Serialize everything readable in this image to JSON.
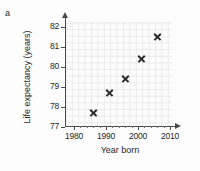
{
  "panel": {
    "label": "a"
  },
  "chart_data": {
    "type": "scatter",
    "title": "",
    "xlabel": "Year born",
    "ylabel": "Life expectancy (years)",
    "xlim": [
      1978,
      2012
    ],
    "ylim": [
      77,
      82.5
    ],
    "xticks": [
      1980,
      1990,
      2000,
      2010
    ],
    "yticks": [
      77,
      78,
      79,
      80,
      81,
      82
    ],
    "xticklabels": [
      "1980",
      "1990",
      "2000",
      "2010"
    ],
    "yticklabels": [
      "77",
      "78",
      "79",
      "80",
      "81",
      "82"
    ],
    "grid": true,
    "legend": false,
    "marker": "x",
    "marker_color": "#2a2a2a",
    "axis_color": "#4a4a4a",
    "grid_color": "#e9e9e9",
    "x": [
      1986,
      1991,
      1996,
      2001,
      2006
    ],
    "y": [
      77.7,
      78.7,
      79.4,
      80.4,
      81.5
    ],
    "points": [
      {
        "x": 1986,
        "y": 77.7
      },
      {
        "x": 1991,
        "y": 78.7
      },
      {
        "x": 1996,
        "y": 79.4
      },
      {
        "x": 2001,
        "y": 80.4
      },
      {
        "x": 2006,
        "y": 81.5
      }
    ]
  }
}
